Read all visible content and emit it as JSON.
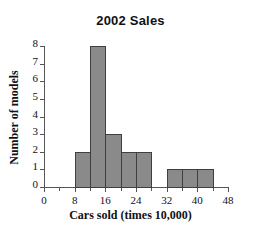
{
  "chart_data": {
    "type": "bar",
    "title": "2002 Sales",
    "xlabel": "Cars sold (times 10,000)",
    "ylabel": "Number of models",
    "xlim": [
      0,
      48
    ],
    "ylim": [
      0,
      8
    ],
    "grid": false,
    "legend": false,
    "bin_width": 4,
    "x_major_ticks": [
      0,
      8,
      16,
      24,
      32,
      40,
      48
    ],
    "x_minor_ticks": [
      4,
      12,
      20,
      28,
      36,
      44
    ],
    "x_tick_labels": [
      "0",
      "8",
      "16",
      "24",
      "32",
      "40",
      "48"
    ],
    "y_ticks": [
      0,
      1,
      2,
      3,
      4,
      5,
      6,
      7,
      8
    ],
    "y_tick_labels": [
      "0",
      "1",
      "2",
      "3",
      "4",
      "5",
      "6",
      "7",
      "8"
    ],
    "bar_color": "#8a8a8a",
    "bar_edge_color": "#3f3f3f",
    "axis_color": "#555555",
    "categories": [
      "8-12",
      "12-16",
      "16-20",
      "20-24",
      "24-28",
      "28-32",
      "32-36",
      "36-40",
      "40-44"
    ],
    "values": [
      2,
      8,
      3,
      2,
      2,
      0,
      1,
      1,
      1
    ],
    "bins": [
      {
        "start": 8,
        "end": 12,
        "value": 2
      },
      {
        "start": 12,
        "end": 16,
        "value": 8
      },
      {
        "start": 16,
        "end": 20,
        "value": 3
      },
      {
        "start": 20,
        "end": 24,
        "value": 2
      },
      {
        "start": 24,
        "end": 28,
        "value": 2
      },
      {
        "start": 28,
        "end": 32,
        "value": 0
      },
      {
        "start": 32,
        "end": 36,
        "value": 1
      },
      {
        "start": 36,
        "end": 40,
        "value": 1
      },
      {
        "start": 40,
        "end": 44,
        "value": 1
      }
    ]
  }
}
